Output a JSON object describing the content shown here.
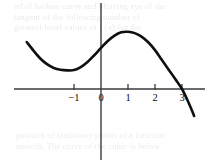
{
  "figure": {
    "name": "cubic-function-graph",
    "background_color": "#ffffff",
    "curve_color": "#101010",
    "axis_color": "#3a3a3a",
    "label_color": "#0d0d0d"
  },
  "ghost_text": {
    "top_lines": [
      "ed of broken curve and blurring eye of the",
      "tangent   of   the following  number of",
      "greatest  local  values of  f (x)  for  the"
    ],
    "bottom_lines": [
      "position  of  stationary  points  of  a  function",
      "smooth.  The  curve  of  the  cubic  is  below"
    ]
  },
  "chart_data": {
    "type": "line",
    "title": "",
    "subtitle": "",
    "xlabel": "",
    "ylabel": "",
    "grid": false,
    "legend": null,
    "xlim": [
      -3.2,
      3.85
    ],
    "ylim": [
      -1.05,
      3.2
    ],
    "x_ticks": [
      -1,
      0,
      1,
      2,
      3
    ],
    "x_tick_labels": [
      "−1",
      "0",
      "1",
      "2",
      "3"
    ],
    "y_ticks": [],
    "y_tick_labels": [],
    "axes": {
      "x_axis_visible": true,
      "y_axis_visible": true,
      "x_axis_at_y": 0,
      "y_axis_at_x": 0,
      "tick_direction": "both",
      "tick_length_px": 5
    },
    "series": [
      {
        "name": "cubic",
        "description": "cubic with local minimum near x = -1 and local maximum at x = 1, crossing the x-axis at x = 3",
        "stroke_width_px": 2.6,
        "x": [
          -2.75,
          -2.5,
          -2.25,
          -2.0,
          -1.75,
          -1.5,
          -1.25,
          -1.0,
          -0.75,
          -0.5,
          -0.25,
          0.0,
          0.25,
          0.5,
          0.75,
          1.0,
          1.25,
          1.5,
          1.75,
          2.0,
          2.25,
          2.5,
          2.75,
          3.0,
          3.25,
          3.45
        ],
        "y": [
          1.74,
          1.42,
          1.13,
          0.92,
          0.78,
          0.71,
          0.69,
          0.7,
          0.81,
          1.0,
          1.25,
          1.52,
          1.78,
          1.98,
          2.1,
          2.12,
          2.07,
          1.94,
          1.73,
          1.44,
          1.08,
          0.72,
          0.37,
          0.0,
          -0.52,
          -1.0
        ]
      }
    ],
    "annotations": [
      {
        "name": "local-minimum",
        "x": -1.04,
        "y": 0.7
      },
      {
        "name": "local-maximum",
        "x": 1.0,
        "y": 2.12
      },
      {
        "name": "x-intercept",
        "x": 3.0,
        "y": 0.0
      }
    ]
  }
}
